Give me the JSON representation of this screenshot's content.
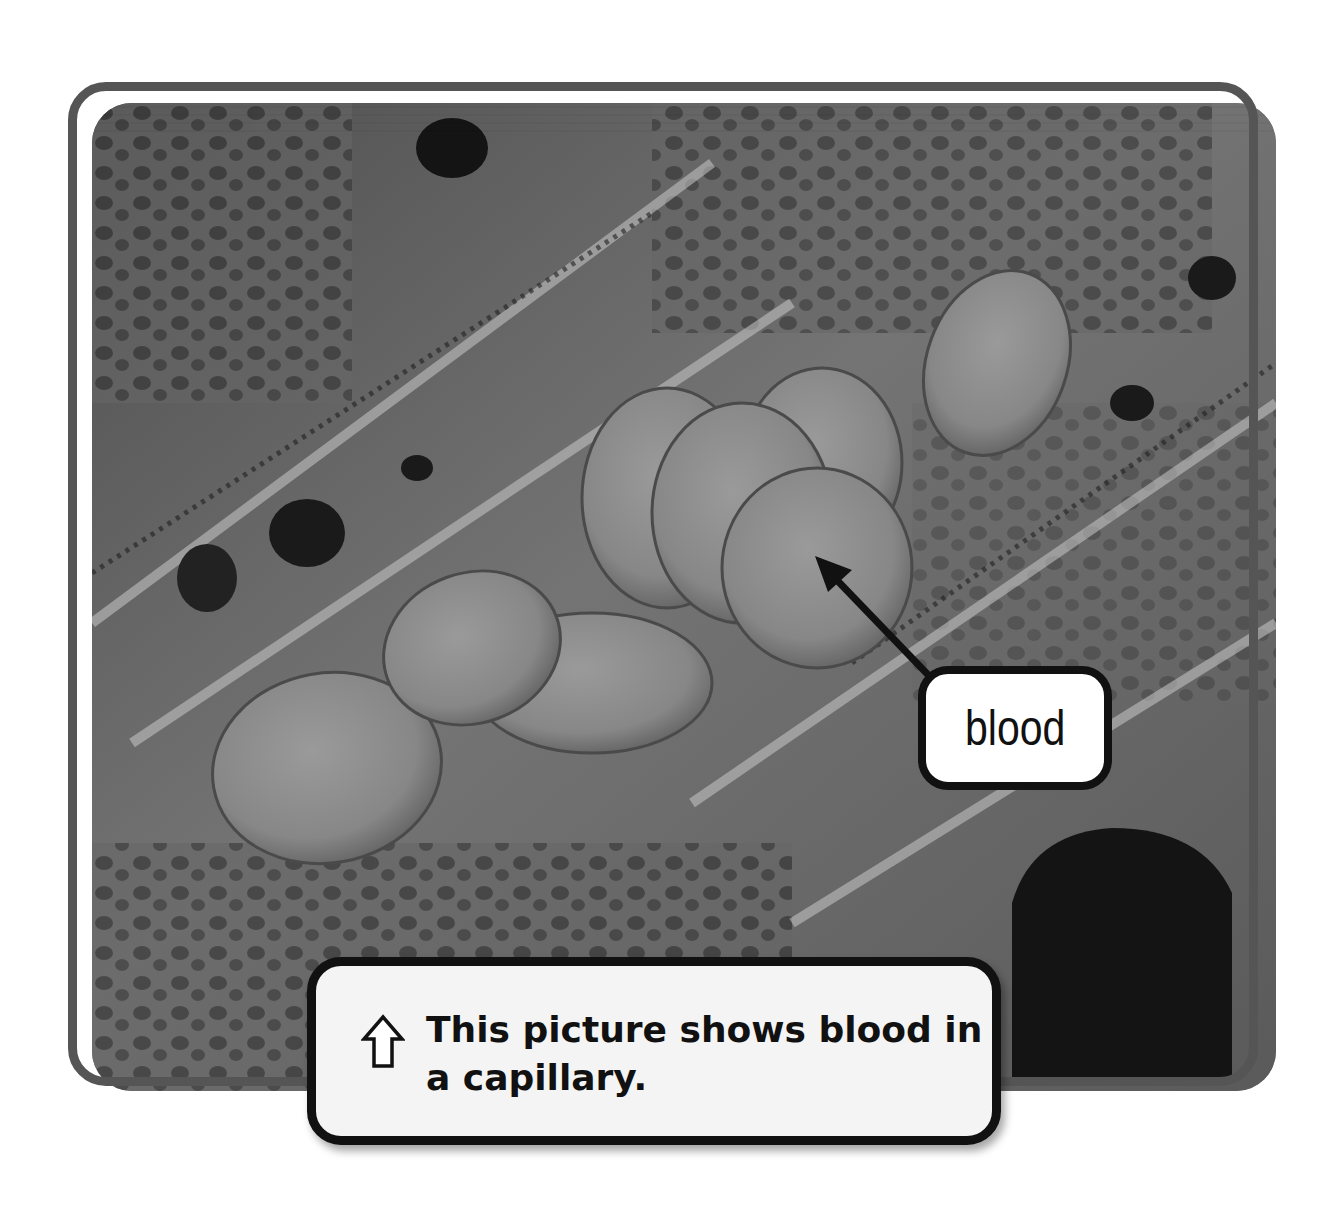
{
  "figure": {
    "image_description": "Scanning electron micrograph of red blood cells inside a capillary",
    "label": {
      "text": "blood",
      "arrow_icon": "arrow-up-left-icon"
    },
    "caption": {
      "icon": "up-arrow-outline-icon",
      "text": "This picture shows blood in a capillary."
    },
    "colors": {
      "frame": "#555555",
      "label_border": "#111111",
      "caption_background": "#f4f4f4",
      "caption_border": "#111111",
      "text": "#111111"
    }
  }
}
